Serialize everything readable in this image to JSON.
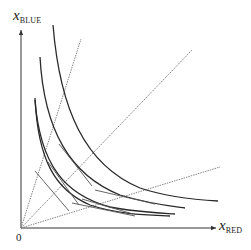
{
  "diagram": {
    "type": "indifference-curves-with-expansion-rays",
    "axes": {
      "y_label": {
        "var": "x",
        "sub": "BLUE"
      },
      "x_label": {
        "var": "x",
        "sub": "RED"
      },
      "origin_label": "0"
    },
    "colors": {
      "axis": "#333333",
      "curve": "#2a2a2a",
      "ray": "#777777",
      "tangent": "#555555"
    },
    "rays": [
      {
        "name": "steep-ray",
        "from": [
          21,
          228
        ],
        "to": [
          81,
          39
        ]
      },
      {
        "name": "diagonal-ray",
        "from": [
          21,
          228
        ],
        "to": [
          192,
          50
        ]
      },
      {
        "name": "shallow-ray",
        "from": [
          21,
          228
        ],
        "to": [
          220,
          167
        ]
      }
    ],
    "curves": [
      {
        "name": "curve-outer",
        "d": "M53,25 C60,110 85,165 140,188 C170,198 200,200 218,201"
      },
      {
        "name": "curve-2",
        "d": "M40,57 C44,130 70,175 120,195 C150,204 170,206 185,208"
      },
      {
        "name": "curve-3",
        "d": "M35,100 C40,165 65,195 110,207 C135,212 160,213 175,214"
      },
      {
        "name": "curve-4",
        "d": "M35,98 C38,160 55,190 90,205 C120,215 150,215 170,216"
      }
    ],
    "tangents": [
      {
        "name": "tangent-1",
        "from": [
          59,
          144
        ],
        "to": [
          92,
          186
        ]
      },
      {
        "name": "tangent-2",
        "from": [
          35,
          171
        ],
        "to": [
          69,
          211
        ]
      },
      {
        "name": "tangent-3",
        "from": [
          48,
          162
        ],
        "to": [
          79,
          205
        ]
      },
      {
        "name": "tangent-4",
        "from": [
          95,
          190
        ],
        "to": [
          155,
          204
        ]
      },
      {
        "name": "tangent-5",
        "from": [
          82,
          199
        ],
        "to": [
          133,
          214
        ]
      },
      {
        "name": "tangent-6",
        "from": [
          72,
          203
        ],
        "to": [
          135,
          216
        ]
      }
    ]
  }
}
